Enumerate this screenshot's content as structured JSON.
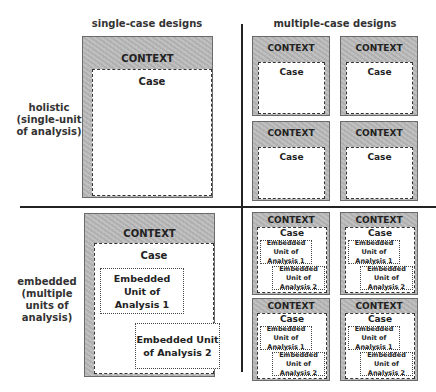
{
  "columns": {
    "single": "single-case designs",
    "multiple": "multiple-case designs"
  },
  "rows": {
    "holistic": [
      "holistic",
      "(single-unit",
      "of analysis)"
    ],
    "embedded": [
      "embedded",
      "(multiple",
      "units of",
      "analysis)"
    ]
  },
  "labels": {
    "context": "CONTEXT",
    "case": "Case",
    "unit1": "Embedded Unit of Analysis 1",
    "unit2": "Embedded Unit of Analysis 2"
  },
  "colors": {
    "context_fill": "#b9b9b9",
    "case_fill": "#ffffff",
    "divider": "#222222"
  }
}
